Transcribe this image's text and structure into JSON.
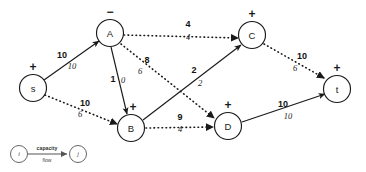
{
  "diagram": {
    "type": "flow-network",
    "title": "",
    "nodes": [
      {
        "id": "s",
        "label": "s",
        "sign": "+",
        "cx": 33,
        "cy": 88,
        "r": 13.5,
        "sign_dx": 0,
        "sign_dy": -21
      },
      {
        "id": "A",
        "label": "A",
        "sign": "−",
        "cx": 110,
        "cy": 33,
        "r": 13.5,
        "sign_dx": 0,
        "sign_dy": -21
      },
      {
        "id": "B",
        "label": "B",
        "sign": "+",
        "cx": 131,
        "cy": 128,
        "r": 13.5,
        "sign_dx": 2,
        "sign_dy": -21
      },
      {
        "id": "C",
        "label": "C",
        "sign": "+",
        "cx": 252,
        "cy": 35,
        "r": 13.5,
        "sign_dx": 0,
        "sign_dy": -21
      },
      {
        "id": "D",
        "label": "D",
        "sign": "+",
        "cx": 228,
        "cy": 126,
        "r": 13.5,
        "sign_dx": 0,
        "sign_dy": -21
      },
      {
        "id": "t",
        "label": "t",
        "sign": "+",
        "cx": 337,
        "cy": 89,
        "r": 13.5,
        "sign_dx": 0,
        "sign_dy": -21
      }
    ],
    "edges": [
      {
        "id": "s-A",
        "from": "s",
        "to": "A",
        "style": "solid",
        "capacity": "10",
        "flow": "10",
        "x1": 44,
        "y1": 80,
        "x2": 99,
        "y2": 41,
        "cap_x": 62,
        "cap_y": 55,
        "flow_x": 72,
        "flow_y": 66
      },
      {
        "id": "s-B",
        "from": "s",
        "to": "B",
        "style": "dotted",
        "capacity": "10",
        "flow": "6",
        "x1": 45,
        "y1": 95,
        "x2": 117,
        "y2": 124,
        "cap_x": 85,
        "cap_y": 103,
        "flow_x": 80,
        "flow_y": 114
      },
      {
        "id": "A-C",
        "from": "A",
        "to": "C",
        "style": "dotted",
        "capacity": "4",
        "flow": "4",
        "x1": 124,
        "y1": 35,
        "x2": 238,
        "y2": 38,
        "cap_x": 188,
        "cap_y": 24,
        "flow_x": 188,
        "flow_y": 37
      },
      {
        "id": "A-D",
        "from": "A",
        "to": "D",
        "style": "dotted",
        "capacity": "8",
        "flow": "6",
        "x1": 121,
        "y1": 44,
        "x2": 214,
        "y2": 118,
        "cap_x": 147,
        "cap_y": 60,
        "flow_x": 140,
        "flow_y": 71
      },
      {
        "id": "A-B",
        "from": "A",
        "to": "B",
        "style": "solid",
        "capacity": "1",
        "flow": "0",
        "x1": 111,
        "y1": 47,
        "x2": 127,
        "y2": 114,
        "cap_x": 113,
        "cap_y": 79,
        "flow_x": 123,
        "flow_y": 80
      },
      {
        "id": "B-C",
        "from": "B",
        "to": "C",
        "style": "solid",
        "capacity": "2",
        "flow": "2",
        "x1": 143,
        "y1": 120,
        "x2": 241,
        "y2": 45,
        "cap_x": 194,
        "cap_y": 70,
        "flow_x": 200,
        "flow_y": 83
      },
      {
        "id": "B-D",
        "from": "B",
        "to": "D",
        "style": "dotted",
        "capacity": "9",
        "flow": "4",
        "x1": 146,
        "y1": 128,
        "x2": 213,
        "y2": 127,
        "cap_x": 180,
        "cap_y": 117,
        "flow_x": 180,
        "flow_y": 129
      },
      {
        "id": "C-t",
        "from": "C",
        "to": "t",
        "style": "dotted",
        "capacity": "10",
        "flow": "6",
        "x1": 264,
        "y1": 44,
        "x2": 324,
        "y2": 78,
        "cap_x": 302,
        "cap_y": 56,
        "flow_x": 295,
        "flow_y": 68
      },
      {
        "id": "D-t",
        "from": "D",
        "to": "t",
        "style": "solid",
        "capacity": "10",
        "flow": "10",
        "x1": 242,
        "y1": 122,
        "x2": 325,
        "y2": 94,
        "cap_x": 283,
        "cap_y": 104,
        "flow_x": 288,
        "flow_y": 116
      }
    ],
    "legend": {
      "from_label": "i",
      "to_label": "j",
      "capacity_text": "capacity",
      "flow_text": "flow"
    }
  }
}
